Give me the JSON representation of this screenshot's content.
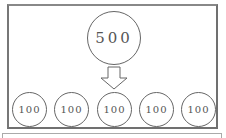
{
  "diagram": {
    "source": {
      "value": "500"
    },
    "arrow": {
      "direction": "down",
      "style": "hollow"
    },
    "targets": [
      {
        "value": "100"
      },
      {
        "value": "100"
      },
      {
        "value": "100"
      },
      {
        "value": "100"
      },
      {
        "value": "100"
      }
    ]
  },
  "colors": {
    "stroke": "#666666",
    "text": "#555555",
    "frame": "#707070",
    "background": "#ffffff"
  }
}
